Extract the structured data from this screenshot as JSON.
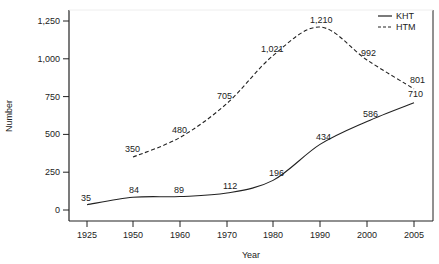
{
  "chart_data": {
    "type": "line",
    "title": "",
    "xlabel": "Year",
    "ylabel": "Number",
    "x_ticks": [
      "1925",
      "1950",
      "1960",
      "1970",
      "1980",
      "1990",
      "2000",
      "2005"
    ],
    "y_ticks": [
      "0",
      "250",
      "500",
      "750",
      "1,000",
      "1,250"
    ],
    "ylim": [
      0,
      1250
    ],
    "grid": false,
    "legend_position": "top-right",
    "series": [
      {
        "name": "KHT",
        "style": "solid",
        "x": [
          "1925",
          "1950",
          "1960",
          "1970",
          "1980",
          "1990",
          "2000",
          "2005"
        ],
        "values": [
          35,
          84,
          89,
          112,
          196,
          434,
          586,
          710
        ],
        "labels": [
          "35",
          "84",
          "89",
          "112",
          "196",
          "434",
          "586",
          "710"
        ]
      },
      {
        "name": "HTM",
        "style": "dashed",
        "x": [
          "1950",
          "1960",
          "1970",
          "1980",
          "1990",
          "2000",
          "2005"
        ],
        "values": [
          350,
          480,
          705,
          1021,
          1210,
          992,
          801
        ],
        "labels": [
          "350",
          "480",
          "705",
          "1,021",
          "1,210",
          "992",
          "801"
        ]
      }
    ]
  },
  "legend": {
    "items": [
      {
        "label": "KHT",
        "style": "solid"
      },
      {
        "label": "HTM",
        "style": "dashed"
      }
    ]
  },
  "colors": {
    "line": "#222222",
    "axis": "#222222",
    "background": "#ffffff"
  }
}
